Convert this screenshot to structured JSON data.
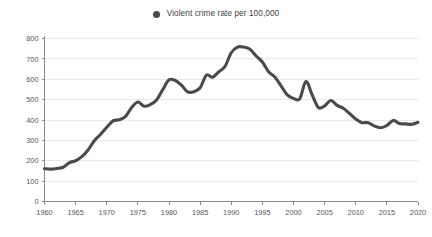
{
  "legend": {
    "marker_name": "legend-dot-icon",
    "marker_color": "#4a4a4a",
    "label": "Violent crime rate per 100,000",
    "position": "top-center"
  },
  "axes": {
    "y_ticks": [
      "0",
      "100",
      "200",
      "300",
      "400",
      "500",
      "600",
      "700",
      "800"
    ],
    "x_ticks": [
      "1960",
      "1965",
      "1970",
      "1975",
      "1980",
      "1985",
      "1990",
      "1995",
      "2000",
      "2005",
      "2010",
      "2015",
      "2020"
    ]
  },
  "colors": {
    "line": "#4a4a4a",
    "grid": "#e9e9ec",
    "axis": "#8a8a8e",
    "text": "#55565a",
    "background": "#ffffff"
  },
  "chart_data": {
    "type": "line",
    "title": "",
    "subtitle": "",
    "xlabel": "",
    "ylabel": "",
    "xlim": [
      1960,
      2020
    ],
    "ylim": [
      0,
      800
    ],
    "grid": true,
    "legend_position": "top-center",
    "series": [
      {
        "name": "Violent crime rate per 100,000",
        "color": "#4a4a4a",
        "x": [
          1960,
          1961,
          1962,
          1963,
          1964,
          1965,
          1966,
          1967,
          1968,
          1969,
          1970,
          1971,
          1972,
          1973,
          1974,
          1975,
          1976,
          1977,
          1978,
          1979,
          1980,
          1981,
          1982,
          1983,
          1984,
          1985,
          1986,
          1987,
          1988,
          1989,
          1990,
          1991,
          1992,
          1993,
          1994,
          1995,
          1996,
          1997,
          1998,
          1999,
          2000,
          2001,
          2002,
          2003,
          2004,
          2005,
          2006,
          2007,
          2008,
          2009,
          2010,
          2011,
          2012,
          2013,
          2014,
          2015,
          2016,
          2017,
          2018,
          2019,
          2020
        ],
        "values": [
          161,
          159,
          162,
          168,
          191,
          200,
          220,
          253,
          298,
          329,
          364,
          396,
          401,
          417,
          461,
          488,
          468,
          476,
          498,
          549,
          597,
          594,
          571,
          538,
          539,
          558,
          620,
          610,
          637,
          663,
          730,
          758,
          758,
          747,
          714,
          685,
          637,
          611,
          568,
          523,
          506,
          504,
          589,
          523,
          461,
          469,
          496,
          472,
          458,
          432,
          405,
          387,
          387,
          370,
          362,
          373,
          398,
          383,
          381,
          379,
          389
        ],
        "y_ticks": [
          0,
          100,
          200,
          300,
          400,
          500,
          600,
          700,
          800
        ],
        "x_ticks": [
          1960,
          1965,
          1970,
          1975,
          1980,
          1985,
          1990,
          1995,
          2000,
          2005,
          2010,
          2015,
          2020
        ]
      }
    ]
  }
}
